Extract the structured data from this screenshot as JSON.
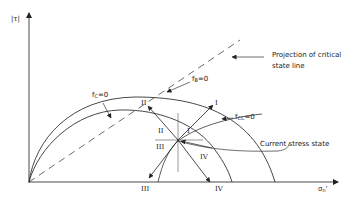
{
  "axes": {
    "y_label": "|τ|",
    "x_label_main": "σ",
    "x_label_sub": "n",
    "x_label_prime": "'"
  },
  "curves": {
    "fc": {
      "name": "f",
      "sub": "C",
      "eq": "=0"
    },
    "fb": {
      "name": "f",
      "sub": "B",
      "eq": "=0"
    },
    "fcc": {
      "name": "f",
      "sub": "CC",
      "eq": "=0"
    }
  },
  "annotations": {
    "projection_line1": "Projection of critical",
    "projection_line2": "state line",
    "current_state": "Current stress state"
  },
  "regions": {
    "I": "I",
    "II": "II",
    "III": "III",
    "IV": "IV"
  },
  "colors": {
    "line": "#333333",
    "background": "#ffffff"
  }
}
